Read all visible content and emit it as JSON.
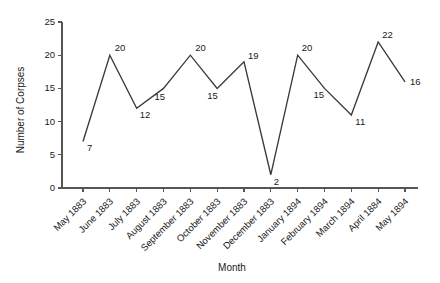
{
  "chart_data": {
    "type": "line",
    "title": "",
    "xlabel": "Month",
    "ylabel": "Number of Corpses",
    "categories": [
      "May 1883",
      "June 1883",
      "July 1883",
      "August 1883",
      "September 1883",
      "October 1883",
      "November 1883",
      "December 1883",
      "January 1894",
      "February 1894",
      "March 1894",
      "April 1884",
      "May 1894"
    ],
    "values": [
      7,
      20,
      12,
      15,
      20,
      15,
      19,
      2,
      20,
      15,
      11,
      22,
      16
    ],
    "point_labels": [
      "7",
      "20",
      "12",
      "15",
      "20",
      "15",
      "19",
      "2",
      "20",
      "15",
      "11",
      "22",
      "16"
    ],
    "ylim": [
      0,
      25
    ],
    "ytick_values": [
      0,
      5,
      10,
      15,
      20,
      25
    ],
    "ytick_labels": [
      "0",
      "5",
      "10",
      "15",
      "20",
      "25"
    ],
    "grid": false,
    "legend": false,
    "line_color": "#3a3a3a",
    "axis_color": "#555555",
    "background_color": "#ffffff",
    "marker": "none"
  }
}
